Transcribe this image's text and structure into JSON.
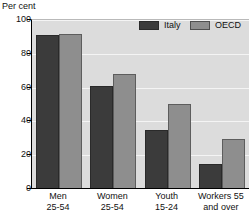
{
  "chart_data": {
    "type": "bar",
    "title": "",
    "xlabel": "",
    "ylabel": "Per cent",
    "unit_label": "Per cent",
    "categories": [
      "Men 25-54",
      "Women 25-54",
      "Youth 15-24",
      "Workers 55 and over"
    ],
    "category_lines": [
      [
        "Men",
        "25-54"
      ],
      [
        "Women",
        "25-54"
      ],
      [
        "Youth",
        "15-24"
      ],
      [
        "Workers 55",
        "and over"
      ]
    ],
    "series": [
      {
        "name": "Italy",
        "color": "#3b3b3b",
        "values": [
          91,
          61,
          35,
          14.5
        ]
      },
      {
        "name": "OECD",
        "color": "#8e8e8e",
        "values": [
          92,
          68,
          50,
          29.5
        ]
      }
    ],
    "ylim": [
      0,
      100
    ],
    "yticks": [
      0,
      20,
      40,
      60,
      80,
      100
    ],
    "ytick_labels": [
      "0",
      "20",
      "40",
      "60",
      "80",
      "100"
    ],
    "grid": true,
    "grid_color": "#f4f4f4",
    "plot_background": "#dcdcdc",
    "legend_position": "top-right",
    "legend": [
      {
        "label": "Italy",
        "color": "#3b3b3b"
      },
      {
        "label": "OECD",
        "color": "#8e8e8e"
      }
    ]
  }
}
